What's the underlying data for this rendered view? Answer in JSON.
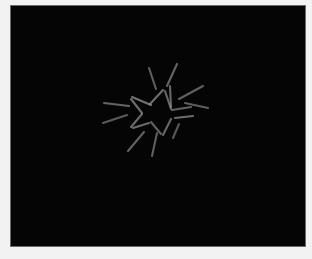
{
  "stimulus": {
    "title": "Star contour visual stimulus",
    "panel_label": "stimulus-display-area",
    "background_color": "#050505",
    "page_margin_color": "#f2f2f2",
    "bevel_color": "#6b6b6b",
    "element_color": "#9a9a9a",
    "element_stroke_width": 2.1,
    "element_linecap": "round",
    "panel": {
      "x": 11,
      "y": 6,
      "width": 294,
      "height": 240
    },
    "center": {
      "x": 144,
      "y": 104
    },
    "contour_shape": "five-pointed-star",
    "contour_element_count": 10,
    "distractor_element_count": 10,
    "total_element_count": 20,
    "contour_elements": [
      {
        "name": "star-edge-upper-left",
        "x1": 121,
        "y1": 91,
        "x2": 140,
        "y2": 99,
        "opacity": 0.72
      },
      {
        "name": "star-edge-top-left-inner",
        "x1": 139,
        "y1": 98,
        "x2": 152,
        "y2": 84,
        "opacity": 0.7
      },
      {
        "name": "star-edge-top-right-inner",
        "x1": 154,
        "y1": 85,
        "x2": 160,
        "y2": 103,
        "opacity": 0.66
      },
      {
        "name": "star-edge-right-upper",
        "x1": 161,
        "y1": 104,
        "x2": 180,
        "y2": 101,
        "opacity": 0.62
      },
      {
        "name": "star-edge-right-lower",
        "x1": 164,
        "y1": 112,
        "x2": 182,
        "y2": 110,
        "opacity": 0.7
      },
      {
        "name": "star-edge-lower-right-inner",
        "x1": 160,
        "y1": 113,
        "x2": 152,
        "y2": 129,
        "opacity": 0.66
      },
      {
        "name": "star-edge-bottom-inner",
        "x1": 150,
        "y1": 128,
        "x2": 140,
        "y2": 116,
        "opacity": 0.62
      },
      {
        "name": "star-edge-lower-left-inner",
        "x1": 138,
        "y1": 117,
        "x2": 122,
        "y2": 122,
        "opacity": 0.68
      },
      {
        "name": "star-edge-left-vertex-upper",
        "x1": 120,
        "y1": 93,
        "x2": 131,
        "y2": 107,
        "opacity": 0.7
      },
      {
        "name": "star-edge-left-vertex-lower",
        "x1": 131,
        "y1": 108,
        "x2": 120,
        "y2": 121,
        "opacity": 0.68
      }
    ],
    "distractor_elements": [
      {
        "name": "ray-up-left",
        "x1": 138,
        "y1": 62,
        "x2": 145,
        "y2": 83,
        "opacity": 0.6
      },
      {
        "name": "ray-up-right",
        "x1": 166,
        "y1": 58,
        "x2": 156,
        "y2": 80,
        "opacity": 0.64
      },
      {
        "name": "ray-vertical-mid",
        "x1": 159,
        "y1": 80,
        "x2": 160,
        "y2": 101,
        "opacity": 0.66
      },
      {
        "name": "ray-upper-right",
        "x1": 192,
        "y1": 80,
        "x2": 168,
        "y2": 93,
        "opacity": 0.62
      },
      {
        "name": "ray-right",
        "x1": 197,
        "y1": 102,
        "x2": 174,
        "y2": 97,
        "opacity": 0.6
      },
      {
        "name": "ray-left-upper",
        "x1": 93,
        "y1": 97,
        "x2": 118,
        "y2": 100,
        "opacity": 0.64
      },
      {
        "name": "ray-left-lower",
        "x1": 92,
        "y1": 117,
        "x2": 116,
        "y2": 109,
        "opacity": 0.58
      },
      {
        "name": "ray-lower-left",
        "x1": 117,
        "y1": 145,
        "x2": 133,
        "y2": 126,
        "opacity": 0.62
      },
      {
        "name": "ray-down",
        "x1": 141,
        "y1": 150,
        "x2": 146,
        "y2": 127,
        "opacity": 0.6
      },
      {
        "name": "ray-lower-right",
        "x1": 162,
        "y1": 132,
        "x2": 168,
        "y2": 118,
        "opacity": 0.56
      }
    ]
  }
}
